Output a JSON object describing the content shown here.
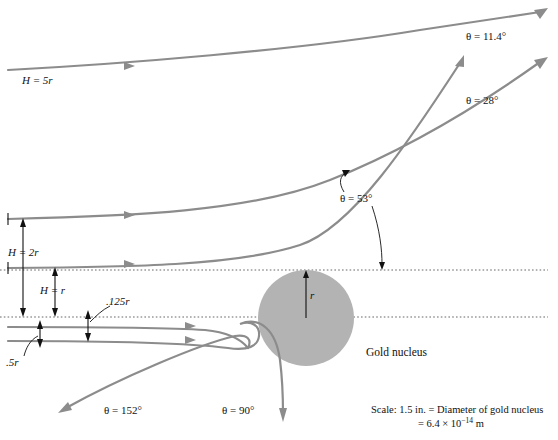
{
  "figure": {
    "nucleus_label": "Gold nucleus",
    "radius_label": "r",
    "background_color": "#ffffff",
    "trajectory_color": "#8c8c8c",
    "nucleus_color": "#b3b3b3",
    "annotation_color": "#111111"
  },
  "impact_parameters": [
    {
      "id": "h5r",
      "label": "H = 5r"
    },
    {
      "id": "h2r",
      "label": "H = 2r"
    },
    {
      "id": "h1r",
      "label": "H = r"
    },
    {
      "id": "h0125r",
      "label": ".125r"
    },
    {
      "id": "h05r",
      "label": ".5r"
    }
  ],
  "deflection_angles": [
    {
      "id": "a114",
      "label": "θ = 11.4°"
    },
    {
      "id": "a28",
      "label": "θ = 28°"
    },
    {
      "id": "a53",
      "label": "θ = 53°"
    },
    {
      "id": "a90",
      "label": "θ = 90°"
    },
    {
      "id": "a152",
      "label": "θ = 152°"
    }
  ],
  "scale_note": {
    "line1": "Scale: 1.5 in. = Diameter of gold nucleus",
    "line2_prefix": "= 6.4 × 10",
    "line2_exponent": "−14",
    "line2_suffix": " m"
  }
}
